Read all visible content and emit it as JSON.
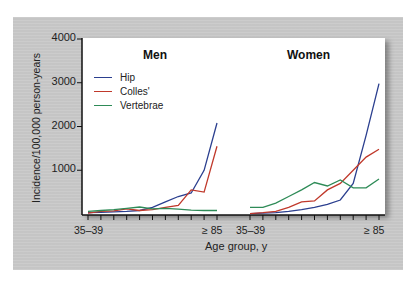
{
  "chart_data": [
    {
      "type": "line",
      "title": "Men",
      "xlabel": "Age group, y",
      "ylabel": "Incidence/100,000 person-years",
      "ylim": [
        0,
        4000
      ],
      "yticks": [
        1000,
        2000,
        3000,
        4000
      ],
      "categories": [
        "35–39",
        "40–44",
        "45–49",
        "50–54",
        "55–59",
        "60–64",
        "65–69",
        "70–74",
        "75–79",
        "80–84",
        "≥ 85"
      ],
      "series": [
        {
          "name": "Hip",
          "color": "#2b3f8f",
          "values": [
            30,
            40,
            50,
            60,
            80,
            150,
            280,
            400,
            480,
            1000,
            2080
          ]
        },
        {
          "name": "Colles'",
          "color": "#c0392b",
          "values": [
            20,
            60,
            70,
            120,
            80,
            100,
            150,
            200,
            550,
            500,
            1550
          ]
        },
        {
          "name": "Vertebrae",
          "color": "#2e8b57",
          "values": [
            60,
            80,
            100,
            130,
            160,
            120,
            130,
            110,
            90,
            80,
            80
          ]
        }
      ]
    },
    {
      "type": "line",
      "title": "Women",
      "xlabel": "Age group, y",
      "ylabel": "Incidence/100,000 person-years",
      "ylim": [
        0,
        4000
      ],
      "yticks": [
        1000,
        2000,
        3000,
        4000
      ],
      "categories": [
        "35–39",
        "40–44",
        "45–49",
        "50–54",
        "55–59",
        "60–64",
        "65–69",
        "70–74",
        "75–79",
        "80–84",
        "≥ 85"
      ],
      "series": [
        {
          "name": "Hip",
          "color": "#2b3f8f",
          "values": [
            10,
            20,
            30,
            60,
            100,
            150,
            220,
            320,
            700,
            1800,
            2980
          ]
        },
        {
          "name": "Colles'",
          "color": "#c0392b",
          "values": [
            10,
            30,
            60,
            150,
            280,
            300,
            550,
            700,
            1000,
            1300,
            1480
          ]
        },
        {
          "name": "Vertebrae",
          "color": "#2e8b57",
          "values": [
            150,
            150,
            250,
            400,
            550,
            720,
            640,
            780,
            600,
            600,
            800
          ]
        }
      ]
    }
  ],
  "axes": {
    "y_ticks": [
      "4000",
      "3000",
      "2000",
      "1000"
    ],
    "y_title": "Incidence/100,000 person-years",
    "x_title": "Age group, y",
    "x_first": "35–39",
    "x_last": "≥ 85"
  },
  "panels": {
    "men_title": "Men",
    "women_title": "Women"
  },
  "legend": [
    {
      "label": "Hip",
      "color": "#2b3f8f"
    },
    {
      "label": "Colles'",
      "color": "#c0392b"
    },
    {
      "label": "Vertebrae",
      "color": "#2e8b57"
    }
  ]
}
